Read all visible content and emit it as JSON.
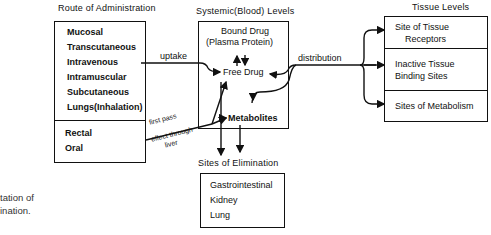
{
  "route": {
    "title": "Route of Administration",
    "upper": [
      "Mucosal",
      "Transcutaneous",
      "Intravenous",
      "Intramuscular",
      "Subcutaneous",
      "Lungs(Inhalation)"
    ],
    "lower": [
      "Rectal",
      "Oral"
    ]
  },
  "systemic": {
    "title": "Systemic(Blood) Levels",
    "bound_line1": "Bound Drug",
    "bound_line2": "(Plasma Protein)",
    "free": "Free Drug",
    "metabolites": "Metabolites"
  },
  "elimination": {
    "title": "Sites of Elimination",
    "items": [
      "Gastrointestinal",
      "Kidney",
      "Lung"
    ]
  },
  "tissue": {
    "title": "Tissue Levels",
    "cells": [
      {
        "line1": "Site of Tissue",
        "line2": "Receptors"
      },
      {
        "line1": "Inactive Tissue",
        "line2": "Binding Sites"
      },
      {
        "line1": "Sites of Metabolism",
        "line2": ""
      }
    ]
  },
  "arrows": {
    "uptake": "uptake",
    "distribution": "distribution",
    "first_pass_1": "first pass",
    "first_pass_2": "effect through",
    "first_pass_3": "liver"
  },
  "caption": {
    "line1": "tation of",
    "line2": "ination."
  }
}
